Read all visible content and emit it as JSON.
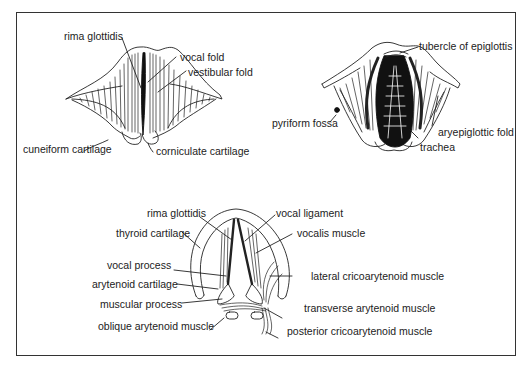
{
  "figure": {
    "panels": [
      {
        "id": "glottis-open-view",
        "labels": [
          "rima glottidis",
          "vocal fold",
          "vestibular fold",
          "cuneiform cartilage",
          "corniculate cartilage"
        ]
      },
      {
        "id": "laryngeal-inlet-view",
        "labels": [
          "tubercle of epiglottis",
          "pyriform fossa",
          "aryepiglottic fold",
          "trachea"
        ]
      },
      {
        "id": "intrinsic-muscles-view",
        "labels": [
          "rima glottidis",
          "vocal ligament",
          "thyroid cartilage",
          "vocalis muscle",
          "vocal process",
          "lateral cricoarytenoid muscle",
          "arytenoid cartilage",
          "muscular process",
          "transverse arytenoid muscle",
          "oblique arytenoid muscle",
          "posterior cricoarytenoid muscle"
        ]
      }
    ]
  },
  "labels": {
    "p1_rima": "rima glottidis",
    "p1_vocal_fold": "vocal fold",
    "p1_vestibular": "vestibular fold",
    "p1_cuneiform": "cuneiform cartilage",
    "p1_corniculate": "corniculate cartilage",
    "p2_tubercle": "tubercle of epiglottis",
    "p2_pyriform": "pyriform fossa",
    "p2_aryepiglottic": "aryepiglottic fold",
    "p2_trachea": "trachea",
    "p3_rima": "rima glottidis",
    "p3_vocal_ligament": "vocal ligament",
    "p3_thyroid": "thyroid cartilage",
    "p3_vocalis": "vocalis muscle",
    "p3_vocal_process": "vocal process",
    "p3_lateral_crico": "lateral cricoarytenoid muscle",
    "p3_arytenoid": "arytenoid cartilage",
    "p3_muscular_process": "muscular process",
    "p3_transverse": "transverse arytenoid muscle",
    "p3_oblique": "oblique arytenoid muscle",
    "p3_posterior_crico": "posterior cricoarytenoid muscle"
  },
  "colors": {
    "line": "#222222",
    "frame": "#333333",
    "background": "#ffffff"
  }
}
